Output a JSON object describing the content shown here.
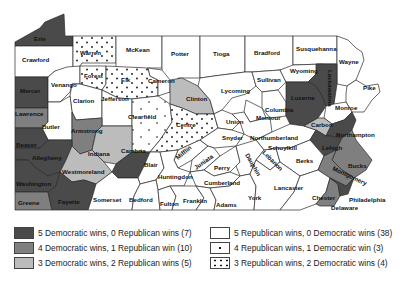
{
  "map": {
    "title": "Pennsylvania counties by presidential election outcomes",
    "colors": {
      "d5": "#4a4a4a",
      "d4": "#7f7f7f",
      "d3": "#bcbcbc",
      "r5": "#ffffff",
      "r4": "#ffffff",
      "r3": "#ffffff"
    },
    "counties": {
      "erie": "Erie",
      "crawford": "Crawford",
      "warren": "Warren",
      "mckean": "McKean",
      "potter": "Potter",
      "tioga": "Tioga",
      "bradford": "Bradford",
      "susquehanna": "Susquehanna",
      "wayne": "Wayne",
      "mercer": "Mercer",
      "venango": "Venango",
      "forest": "Forest",
      "elk": "Elk",
      "cameron": "Cameron",
      "clinton": "Clinton",
      "lycoming": "Lycoming",
      "sullivan": "Sullivan",
      "wyoming": "Wyoming",
      "lackawanna": "Lackawanna",
      "pike": "Pike",
      "lawrence": "Lawrence",
      "clarion": "Clarion",
      "jefferson": "Jefferson",
      "butler": "Butler",
      "armstrong": "Armstrong",
      "clearfield": "Clearfield",
      "centre": "Centre",
      "union": "Union",
      "columbia": "Columbia",
      "montour": "Montour",
      "luzerne": "Luzerne",
      "monroe": "Monroe",
      "beaver": "Beaver",
      "allegheny": "Allegheny",
      "indiana": "Indiana",
      "cambria": "Cambria",
      "blair": "Blair",
      "mifflin": "Mifflin",
      "snyder": "Snyder",
      "northumberland": "Northumberland",
      "schuylkill": "Schuylkill",
      "carbon": "Carbon",
      "northampton": "Northampton",
      "lehigh": "Lehigh",
      "westmoreland": "Westmoreland",
      "washington": "Washington",
      "juniata": "Juniata",
      "huntingdon": "Huntingdon",
      "perry": "Perry",
      "dauphin": "Dauphin",
      "lebanon": "Lebanon",
      "berks": "Berks",
      "bucks": "Bucks",
      "montgomery": "Montgomery",
      "cumberland": "Cumberland",
      "greene": "Greene",
      "fayette": "Fayette",
      "somerset": "Somerset",
      "bedford": "Bedford",
      "fulton": "Fulton",
      "franklin": "Franklin",
      "adams": "Adams",
      "york": "York",
      "lancaster": "Lancaster",
      "chester": "Chester",
      "delaware": "Delaware",
      "philadelphia": "Philadelphia"
    }
  },
  "legend": {
    "items": [
      {
        "key": "d5",
        "label": "5 Democratic wins, 0 Republican wins (7)"
      },
      {
        "key": "d4",
        "label": "4 Democratic wins, 1 Republican win (10)"
      },
      {
        "key": "d3",
        "label": "3 Democratic wins, 2 Republican wins (5)"
      },
      {
        "key": "r5",
        "label": "5 Republican wins, 0 Democratic wins (38)"
      },
      {
        "key": "r4",
        "label": "4 Republican wins, 1 Democratic win (3)"
      },
      {
        "key": "r3",
        "label": "3 Republican wins, 2 Democratic wins (4)"
      }
    ]
  }
}
